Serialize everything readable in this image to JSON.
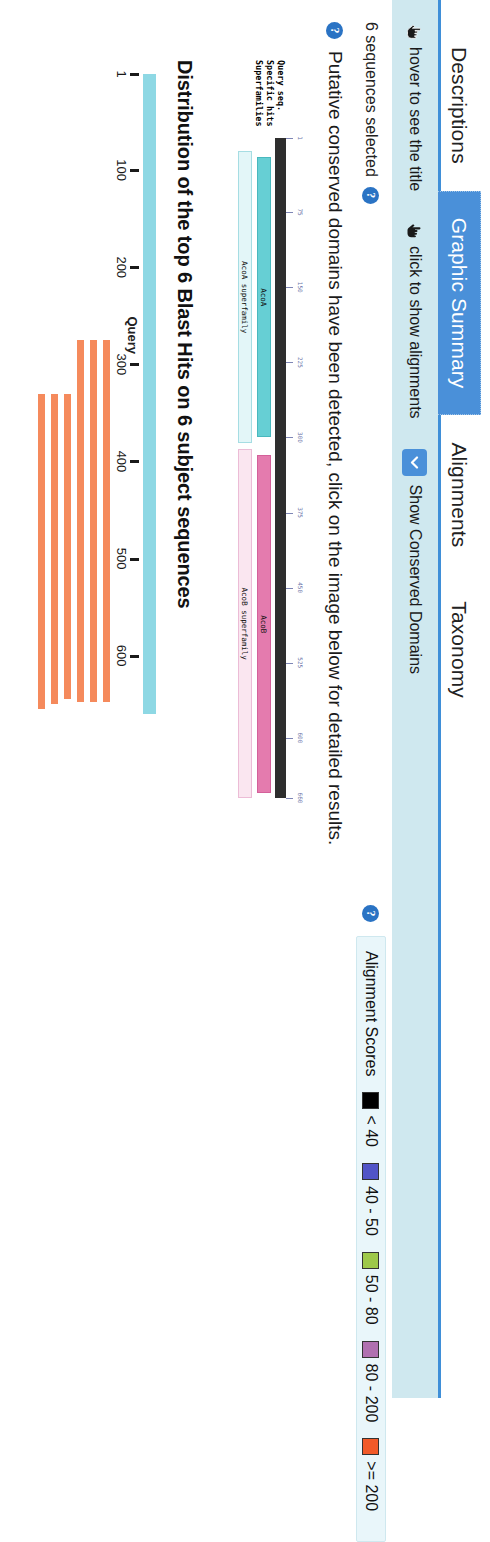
{
  "tabs": [
    {
      "label": "Descriptions",
      "active": false
    },
    {
      "label": "Graphic Summary",
      "active": true
    },
    {
      "label": "Alignments",
      "active": false
    },
    {
      "label": "Taxonomy",
      "active": false
    }
  ],
  "toolbar": {
    "hover_label": "hover to see the title",
    "click_label": "click to show alignments",
    "conserved_domains_label": "Show Conserved Domains",
    "hover_icon": "hand-pointer-icon",
    "click_icon": "hand-pointer-icon",
    "conserved_domains_icon": "chevron-down-icon"
  },
  "selection": {
    "text": "6 sequences selected",
    "help_icon": "help-circle-icon",
    "help_glyph": "?"
  },
  "conserved_domains": {
    "help_icon": "help-circle-icon",
    "help_glyph": "?",
    "message": "Putative conserved domains have been detected, click on the image below for detailed results.",
    "row_labels": "Query seq.\nSpecific hits\nSuperfamilies",
    "rows": [
      "Query seq.",
      "Specific hits",
      "Superfamilies"
    ],
    "ruler": {
      "start": 1,
      "end": 660,
      "ticks": [
        1,
        75,
        150,
        225,
        300,
        375,
        450,
        525,
        600,
        660
      ]
    },
    "hits": [
      {
        "name": "AcoA",
        "track": "specific",
        "style": "teal",
        "start": 20,
        "end": 300
      },
      {
        "name": "AcoB",
        "track": "specific",
        "style": "pink",
        "start": 318,
        "end": 655
      },
      {
        "name": "AcoA superfamily",
        "track": "superfamily",
        "style": "tealsf",
        "start": 14,
        "end": 306
      },
      {
        "name": "AcoB superfamily",
        "track": "superfamily",
        "style": "pinksf",
        "start": 312,
        "end": 660
      }
    ]
  },
  "chart_data": {
    "type": "bar",
    "title": "Distribution of the top 6 Blast Hits on 6 subject sequences",
    "xlabel": "Query",
    "ylabel": "",
    "query_label": "Query",
    "xlim": [
      1,
      660
    ],
    "tick_values": [
      1,
      100,
      200,
      300,
      400,
      500,
      600
    ],
    "tick_labels": [
      "1",
      "100",
      "200",
      "300",
      "400",
      "500",
      "600"
    ],
    "grid": false,
    "legend_position": "top",
    "bar_color": "#f58a5c",
    "query_bar_color": "#8ed8e4",
    "series": [
      {
        "name": "hit 1",
        "start": 275,
        "end": 648,
        "score_bin": ">= 200"
      },
      {
        "name": "hit 2",
        "start": 275,
        "end": 648,
        "score_bin": ">= 200"
      },
      {
        "name": "hit 3",
        "start": 275,
        "end": 648,
        "score_bin": ">= 200"
      },
      {
        "name": "hit 4",
        "start": 330,
        "end": 645,
        "score_bin": ">= 200"
      },
      {
        "name": "hit 5",
        "start": 330,
        "end": 650,
        "score_bin": ">= 200"
      },
      {
        "name": "hit 6",
        "start": 330,
        "end": 655,
        "score_bin": ">= 200"
      }
    ]
  },
  "legend": {
    "title": "Alignment Scores",
    "help_icon": "help-circle-icon",
    "help_glyph": "?",
    "items": [
      {
        "label": "< 40",
        "color": "#000000"
      },
      {
        "label": "40 - 50",
        "color": "#5154c7"
      },
      {
        "label": "50 - 80",
        "color": "#9ec94a"
      },
      {
        "label": "80 - 200",
        "color": "#b070b0"
      },
      {
        "label": ">= 200",
        "color": "#f15a29"
      }
    ]
  }
}
